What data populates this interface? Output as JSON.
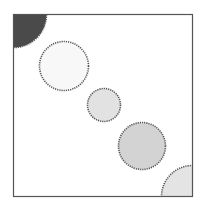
{
  "canvas": {
    "width": 201,
    "height": 209,
    "background": "#ffffff"
  },
  "frame": {
    "x": 13.5,
    "y": 14.5,
    "width": 179,
    "height": 182,
    "stroke": "#555555"
  },
  "shapes": [
    {
      "name": "corner-quarter-circle-top-left",
      "cx": 13.5,
      "cy": 14.5,
      "r": 33,
      "fill": "#4a4a4a"
    },
    {
      "name": "circle-1",
      "cx": 64,
      "cy": 66,
      "r": 24.5,
      "fill": "#f8f8f8"
    },
    {
      "name": "circle-2",
      "cx": 104,
      "cy": 105,
      "r": 16.5,
      "fill": "#e2e2e2"
    },
    {
      "name": "circle-3",
      "cx": 142,
      "cy": 146,
      "r": 23.5,
      "fill": "#d3d3d3"
    },
    {
      "name": "corner-quarter-circle-bottom-right",
      "cx": 192.5,
      "cy": 196.5,
      "r": 31,
      "fill": "#e4e4e4"
    }
  ],
  "outline": {
    "stroke": "#555555",
    "dash": "1.2 1"
  }
}
